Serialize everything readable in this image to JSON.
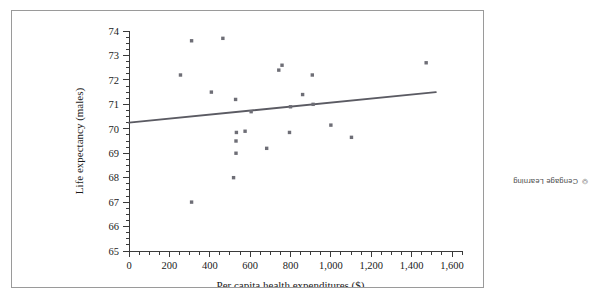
{
  "figure": {
    "attribution": "© Cengage Learning"
  },
  "chart_data": {
    "type": "scatter",
    "title": "",
    "xlabel": "Per capita health expenditures ($)",
    "ylabel": "Life expectancy (males)",
    "xlim": [
      0,
      1600
    ],
    "ylim": [
      65,
      74
    ],
    "grid": false,
    "legend": null,
    "x_ticks": [
      0,
      200,
      400,
      600,
      800,
      1000,
      1200,
      1400,
      1600
    ],
    "x_tick_labels": [
      "0",
      "200",
      "400",
      "600",
      "800",
      "1,000",
      "1,200",
      "1,400",
      "1,600"
    ],
    "x_minor_tick_step": 50,
    "y_ticks": [
      65,
      66,
      67,
      68,
      69,
      70,
      71,
      72,
      73,
      74
    ],
    "y_tick_labels": [
      "65",
      "66",
      "67",
      "68",
      "69",
      "70",
      "71",
      "72",
      "73",
      "74"
    ],
    "y_minor_tick_step": 0.25,
    "point_color": "#6e6e76",
    "line_color": "#5b5b63",
    "points": [
      {
        "x": 255,
        "y": 72.2
      },
      {
        "x": 310,
        "y": 73.6
      },
      {
        "x": 310,
        "y": 67.0
      },
      {
        "x": 408,
        "y": 71.5
      },
      {
        "x": 465,
        "y": 73.7
      },
      {
        "x": 518,
        "y": 68.0
      },
      {
        "x": 528,
        "y": 71.2
      },
      {
        "x": 530,
        "y": 69.0
      },
      {
        "x": 530,
        "y": 69.5
      },
      {
        "x": 532,
        "y": 69.85
      },
      {
        "x": 575,
        "y": 69.9
      },
      {
        "x": 605,
        "y": 70.7
      },
      {
        "x": 682,
        "y": 69.2
      },
      {
        "x": 742,
        "y": 72.4
      },
      {
        "x": 758,
        "y": 72.6
      },
      {
        "x": 795,
        "y": 69.85
      },
      {
        "x": 800,
        "y": 70.9
      },
      {
        "x": 860,
        "y": 71.4
      },
      {
        "x": 908,
        "y": 72.2
      },
      {
        "x": 912,
        "y": 71.0
      },
      {
        "x": 1000,
        "y": 70.15
      },
      {
        "x": 1102,
        "y": 69.65
      },
      {
        "x": 1472,
        "y": 72.7
      }
    ],
    "trend_line": {
      "x_start": 0,
      "y_start": 70.25,
      "x_end": 1520,
      "y_end": 71.5
    }
  }
}
